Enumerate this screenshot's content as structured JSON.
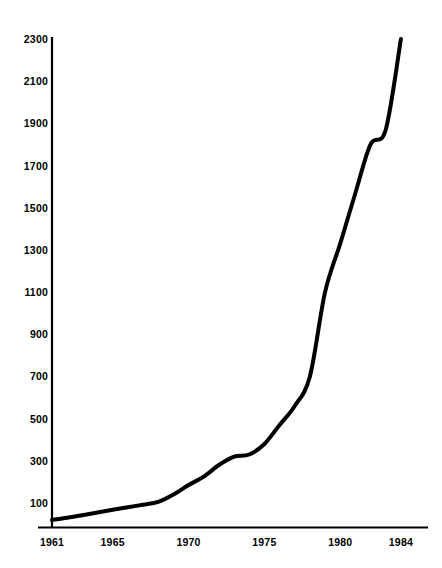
{
  "chart_data": {
    "type": "line",
    "title": "",
    "subtitle": "",
    "xlabel": "",
    "ylabel": "",
    "xlim": [
      1961,
      1984
    ],
    "ylim": [
      0,
      2300
    ],
    "grid": false,
    "legend": null,
    "legend_position": "none",
    "line_color": "#000000",
    "line_width": 4,
    "axis_color": "#000000",
    "background_color": "#ffffff",
    "x_tick_labels": [
      "1961",
      "1965",
      "1970",
      "1975",
      "1980",
      "1984"
    ],
    "x_ticks": [
      1961,
      1965,
      1970,
      1975,
      1980,
      1984
    ],
    "y_tick_labels": [
      "100",
      "300",
      "500",
      "700",
      "900",
      "1100",
      "1300",
      "1500",
      "1700",
      "1900",
      "2100",
      "2300"
    ],
    "y_ticks": [
      100,
      300,
      500,
      700,
      900,
      1100,
      1300,
      1500,
      1700,
      1900,
      2100,
      2300
    ],
    "series": [
      {
        "name": "series-1",
        "x": [
          1961,
          1962,
          1963,
          1964,
          1965,
          1966,
          1967,
          1968,
          1969,
          1970,
          1971,
          1972,
          1973,
          1974,
          1975,
          1976,
          1977,
          1978,
          1979,
          1980,
          1981,
          1982,
          1983,
          1984
        ],
        "values": [
          20,
          30,
          42,
          55,
          68,
          80,
          92,
          105,
          140,
          185,
          225,
          280,
          320,
          330,
          380,
          470,
          560,
          700,
          1100,
          1330,
          1570,
          1800,
          1870,
          2300
        ]
      }
    ]
  },
  "axes": {
    "y_axis_name": "y-axis",
    "x_axis_name": "x-axis"
  }
}
